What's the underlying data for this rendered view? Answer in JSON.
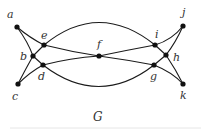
{
  "caption": "G",
  "nodes": [
    {
      "id": "a",
      "label": "a",
      "x": 17,
      "y": 27,
      "lx": 7,
      "ly": 18
    },
    {
      "id": "b",
      "label": "b",
      "x": 33,
      "y": 56,
      "lx": 20,
      "ly": 60
    },
    {
      "id": "c",
      "label": "c",
      "x": 18,
      "y": 84,
      "lx": 12,
      "ly": 100
    },
    {
      "id": "d",
      "label": "d",
      "x": 43,
      "y": 65,
      "lx": 38,
      "ly": 80
    },
    {
      "id": "e",
      "label": "e",
      "x": 44,
      "y": 45,
      "lx": 41,
      "ly": 39
    },
    {
      "id": "f",
      "label": "f",
      "x": 99,
      "y": 56,
      "lx": 97,
      "ly": 48
    },
    {
      "id": "g",
      "label": "g",
      "x": 154,
      "y": 65,
      "lx": 150,
      "ly": 80
    },
    {
      "id": "h",
      "label": "h",
      "x": 166,
      "y": 55,
      "lx": 173,
      "ly": 61
    },
    {
      "id": "i",
      "label": "i",
      "x": 155,
      "y": 45,
      "lx": 155,
      "ly": 38
    },
    {
      "id": "j",
      "label": "j",
      "x": 183,
      "y": 26,
      "lx": 182,
      "ly": 16
    },
    {
      "id": "k",
      "label": "k",
      "x": 183,
      "y": 84,
      "lx": 180,
      "ly": 99
    }
  ],
  "edges": [
    {
      "d": "M17,27 Q28,42 33,56"
    },
    {
      "d": "M17,27 Q30,38 44,45"
    },
    {
      "d": "M33,56 L44,45"
    },
    {
      "d": "M33,56 L43,65"
    },
    {
      "d": "M33,56 Q24,72 18,84"
    },
    {
      "d": "M18,84 Q30,72 43,65"
    },
    {
      "d": "M44,45 Q72,52 99,56"
    },
    {
      "d": "M43,65 Q70,58 99,56"
    },
    {
      "d": "M99,56 Q128,50 155,45"
    },
    {
      "d": "M99,56 Q128,60 154,65"
    },
    {
      "d": "M44,45 Q99,0 155,45"
    },
    {
      "d": "M43,65 Q99,108 154,65"
    },
    {
      "d": "M155,45 Q172,40 183,26"
    },
    {
      "d": "M155,45 L166,55"
    },
    {
      "d": "M166,55 Q176,42 183,26"
    },
    {
      "d": "M166,55 L154,65"
    },
    {
      "d": "M166,55 Q176,70 183,84"
    },
    {
      "d": "M154,65 Q172,72 183,84"
    }
  ]
}
